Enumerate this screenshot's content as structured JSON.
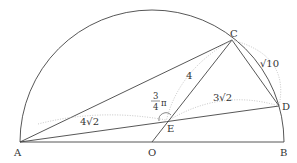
{
  "diagram": {
    "points": {
      "A": {
        "label": "A"
      },
      "O": {
        "label": "O"
      },
      "B": {
        "label": "B"
      },
      "C": {
        "label": "C"
      },
      "D": {
        "label": "D"
      },
      "E": {
        "label": "E"
      }
    },
    "lengths": {
      "AE": "4√2",
      "CE": "4",
      "ED": "3√2",
      "CD": "√10"
    },
    "angle": {
      "numerator": "3",
      "denominator": "4",
      "symbol": "π"
    },
    "colors": {
      "line": "#333333",
      "dotted": "#aaaaaa",
      "background": "#ffffff"
    }
  }
}
